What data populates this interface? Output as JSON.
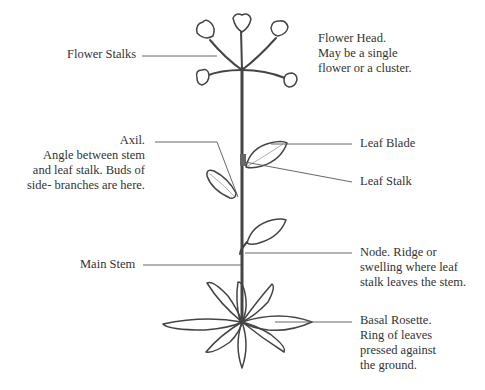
{
  "diagram": {
    "labels": {
      "flower_stalks": "Flower Stalks",
      "flower_head": [
        "Flower Head.",
        "May be a single",
        "flower or a cluster."
      ],
      "axil": [
        "Axil.",
        "Angle between stem",
        "and leaf stalk. Buds of",
        "side- branches are here."
      ],
      "leaf_blade": "Leaf Blade",
      "leaf_stalk": "Leaf Stalk",
      "main_stem": "Main Stem",
      "node": [
        "Node. Ridge or",
        "swelling where leaf",
        "stalk leaves the stem."
      ],
      "basal_rosette": [
        "Basal Rosette.",
        "Ring of leaves",
        "pressed against",
        "the ground."
      ]
    },
    "colors": {
      "ink": "#444444",
      "leader": "#555555",
      "text": "#333333"
    }
  }
}
